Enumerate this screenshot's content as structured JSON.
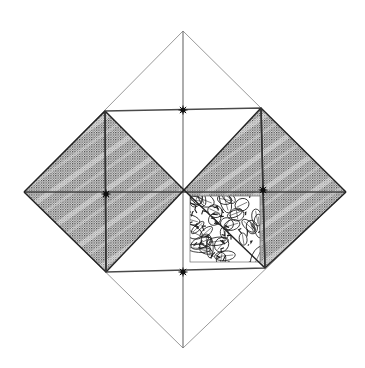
{
  "canvas": {
    "width": 365,
    "height": 368,
    "background": "#ffffff"
  },
  "colors": {
    "outer_line": "#9a9a9a",
    "inner_line": "#4a4a4a",
    "shade_dot": "#2e2e2e",
    "shade_bg": "#d8d8d8",
    "leaf_line": "#1e1e1e",
    "star": "#111111"
  },
  "outer_diamond": {
    "top": [
      183,
      31
    ],
    "right": [
      346,
      192
    ],
    "bottom": [
      183,
      348
    ],
    "left": [
      24,
      192
    ]
  },
  "inner_square": {
    "top_left": [
      105,
      111
    ],
    "top_right": [
      261,
      108
    ],
    "bottom_right": [
      265,
      268
    ],
    "bottom_left": [
      106,
      272
    ]
  },
  "center": [
    184,
    190
  ],
  "shaded_regions": [
    {
      "name": "left-diamond",
      "points": [
        [
          105,
          111
        ],
        [
          184,
          190
        ],
        [
          106,
          272
        ],
        [
          24,
          192
        ]
      ]
    },
    {
      "name": "right-diamond",
      "points": [
        [
          261,
          108
        ],
        [
          346,
          192
        ],
        [
          265,
          268
        ],
        [
          184,
          190
        ]
      ]
    }
  ],
  "leaf_square": {
    "x": 190,
    "y": 196,
    "width": 70,
    "height": 66
  },
  "markers": [
    {
      "name": "top-star",
      "at": [
        183,
        110
      ]
    },
    {
      "name": "left-star",
      "at": [
        106,
        194
      ]
    },
    {
      "name": "right-star",
      "at": [
        263,
        190
      ]
    },
    {
      "name": "bottom-star",
      "at": [
        183,
        272
      ]
    }
  ]
}
